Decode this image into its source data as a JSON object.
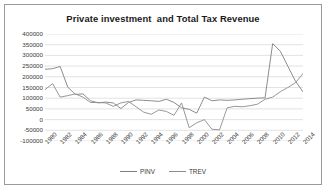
{
  "chart_data": {
    "type": "line",
    "title": "Private investment  and Total Tax Revenue",
    "xlabel": "",
    "ylabel": "",
    "ylim": [
      -100000,
      400000
    ],
    "ytick_step": 50000,
    "yticks": [
      400000,
      350000,
      300000,
      250000,
      200000,
      150000,
      100000,
      50000,
      0,
      -50000,
      -100000
    ],
    "ytick_labels": [
      "400000",
      "350000",
      "300000",
      "250000",
      "200000",
      "150000",
      "100000",
      "50000",
      "0",
      "-50000",
      "-100000"
    ],
    "grid": true,
    "legend_position": "bottom",
    "x": [
      1980,
      1981,
      1982,
      1983,
      1984,
      1985,
      1986,
      1987,
      1988,
      1989,
      1990,
      1991,
      1992,
      1993,
      1994,
      1995,
      1996,
      1997,
      1998,
      1999,
      2000,
      2001,
      2002,
      2003,
      2004,
      2005,
      2006,
      2007,
      2008,
      2009,
      2010,
      2011,
      2012,
      2013,
      2014
    ],
    "xtick_labels": [
      "1980",
      "1982",
      "1984",
      "1986",
      "1988",
      "1990",
      "1992",
      "1994",
      "1996",
      "1998",
      "2000",
      "2002",
      "2004",
      "2006",
      "2008",
      "2010",
      "2012",
      "2014"
    ],
    "series": [
      {
        "name": "PINV",
        "color": "#808080",
        "values": [
          235000,
          238000,
          248000,
          152000,
          118000,
          120000,
          88000,
          78000,
          82000,
          78000,
          52000,
          80000,
          92000,
          90000,
          88000,
          85000,
          95000,
          80000,
          55000,
          48000,
          30000,
          105000,
          88000,
          92000,
          90000,
          92000,
          95000,
          98000,
          100000,
          102000,
          355000,
          320000,
          250000,
          180000,
          130000
        ]
      },
      {
        "name": "TREV",
        "color": "#8c8c8c",
        "values": [
          140000,
          168000,
          105000,
          112000,
          120000,
          105000,
          80000,
          80000,
          78000,
          62000,
          78000,
          85000,
          60000,
          35000,
          25000,
          45000,
          38000,
          20000,
          78000,
          -38000,
          -15000,
          0,
          -45000,
          -48000,
          55000,
          62000,
          60000,
          65000,
          72000,
          95000,
          105000,
          130000,
          150000,
          172000,
          215000
        ]
      }
    ]
  }
}
